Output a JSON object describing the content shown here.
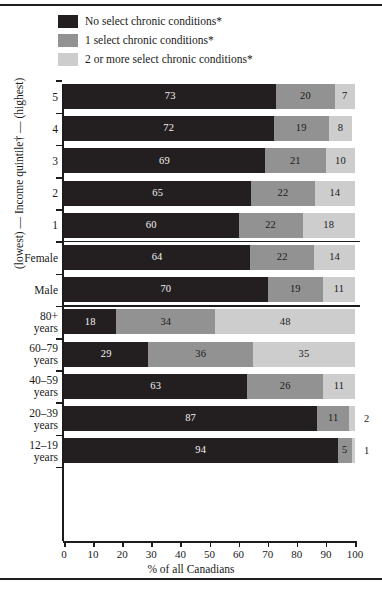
{
  "figure": {
    "x_axis_title": "% of all Canadians",
    "y_axis_title": "(lowest) — Income quintile† — (highest)"
  },
  "legend": {
    "items": [
      {
        "label": "No select chronic conditions*",
        "color": "#231f20",
        "swatch_name": "legend-swatch-none"
      },
      {
        "label": "1 select chronic conditions*",
        "color": "#929292",
        "swatch_name": "legend-swatch-one"
      },
      {
        "label": "2 or more select chronic conditions*",
        "color": "#cdcdcd",
        "swatch_name": "legend-swatch-two-plus"
      }
    ]
  },
  "chart_data": {
    "type": "bar",
    "orientation": "horizontal",
    "stacked": true,
    "title": "",
    "xlabel": "% of all Canadians",
    "ylabel": "(lowest) — Income quintile† — (highest)",
    "xlim": [
      0,
      100
    ],
    "xticks": [
      0,
      10,
      20,
      30,
      40,
      50,
      60,
      70,
      80,
      90,
      100
    ],
    "grid": false,
    "legend_position": "top",
    "series": [
      {
        "name": "No select chronic conditions*",
        "color": "#231f20",
        "values": [
          73,
          72,
          69,
          65,
          60,
          64,
          70,
          18,
          29,
          63,
          87,
          94
        ]
      },
      {
        "name": "1 select chronic conditions*",
        "color": "#929292",
        "values": [
          20,
          19,
          21,
          22,
          22,
          22,
          19,
          34,
          36,
          26,
          11,
          5
        ]
      },
      {
        "name": "2 or more select chronic conditions*",
        "color": "#cdcdcd",
        "values": [
          7,
          8,
          10,
          14,
          18,
          14,
          11,
          48,
          35,
          11,
          2,
          1
        ]
      }
    ],
    "categories": [
      "5",
      "4",
      "3",
      "2",
      "1",
      "Female",
      "Male",
      "80+ years",
      "60–79 years",
      "40–59 years",
      "20–39 years",
      "12–19 years"
    ]
  },
  "rows": [
    {
      "label_line1": "5",
      "label_line2": "",
      "values": [
        73,
        20,
        7
      ],
      "outside": ""
    },
    {
      "label_line1": "4",
      "label_line2": "",
      "values": [
        72,
        19,
        8
      ],
      "outside": ""
    },
    {
      "label_line1": "3",
      "label_line2": "",
      "values": [
        69,
        21,
        10
      ],
      "outside": ""
    },
    {
      "label_line1": "2",
      "label_line2": "",
      "values": [
        65,
        22,
        14
      ],
      "outside": ""
    },
    {
      "label_line1": "1",
      "label_line2": "",
      "values": [
        60,
        22,
        18
      ],
      "outside": ""
    },
    {
      "label_line1": "Female",
      "label_line2": "",
      "values": [
        64,
        22,
        14
      ],
      "outside": ""
    },
    {
      "label_line1": "Male",
      "label_line2": "",
      "values": [
        70,
        19,
        11
      ],
      "outside": ""
    },
    {
      "label_line1": "80+",
      "label_line2": "years",
      "values": [
        18,
        34,
        48
      ],
      "outside": ""
    },
    {
      "label_line1": "60–79",
      "label_line2": "years",
      "values": [
        29,
        36,
        35
      ],
      "outside": ""
    },
    {
      "label_line1": "40–59",
      "label_line2": "years",
      "values": [
        63,
        26,
        11
      ],
      "outside": ""
    },
    {
      "label_line1": "20–39",
      "label_line2": "years",
      "values": [
        87,
        11,
        2
      ],
      "outside": "2"
    },
    {
      "label_line1": "12–19",
      "label_line2": "years",
      "values": [
        94,
        5,
        1
      ],
      "outside": "1"
    }
  ],
  "xticklabels": [
    "0",
    "10",
    "20",
    "30",
    "40",
    "50",
    "60",
    "70",
    "80",
    "90",
    "100"
  ]
}
